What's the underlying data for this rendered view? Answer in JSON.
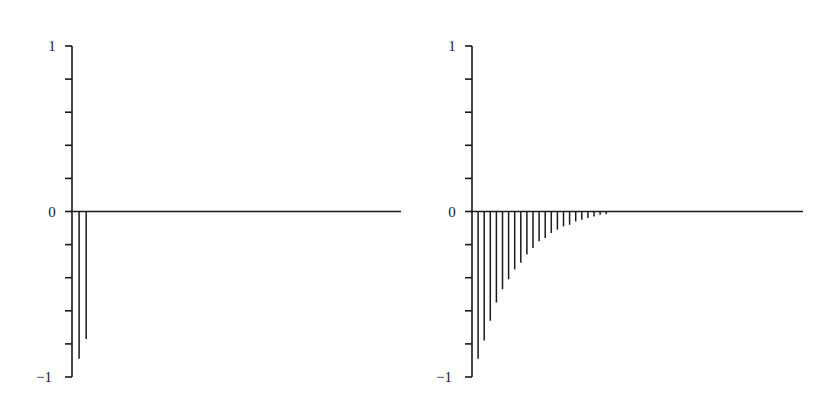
{
  "chart_data": [
    {
      "type": "bar",
      "subtype": "stem",
      "title": "",
      "xlabel": "",
      "ylabel": "",
      "ylim": [
        -1,
        1
      ],
      "yticks": [
        -1,
        -0.8,
        -0.6,
        -0.4,
        -0.2,
        0,
        0.2,
        0.4,
        0.6,
        0.8,
        1
      ],
      "ytick_labels": [
        {
          "value": 1,
          "label": "1"
        },
        {
          "value": 0,
          "label": "0"
        },
        {
          "value": -1,
          "label": "−1"
        }
      ],
      "grid": false,
      "lags": 50,
      "x": [
        1,
        2
      ],
      "values": [
        -0.89,
        -0.77
      ]
    },
    {
      "type": "bar",
      "subtype": "stem",
      "title": "",
      "xlabel": "",
      "ylabel": "",
      "ylim": [
        -1,
        1
      ],
      "yticks": [
        -1,
        -0.8,
        -0.6,
        -0.4,
        -0.2,
        0,
        0.2,
        0.4,
        0.6,
        0.8,
        1
      ],
      "ytick_labels": [
        {
          "value": 1,
          "label": "1"
        },
        {
          "value": 0,
          "label": "0"
        },
        {
          "value": -1,
          "label": "−1"
        }
      ],
      "grid": false,
      "lags": 50,
      "x": [
        1,
        2,
        3,
        4,
        5,
        6,
        7,
        8,
        9,
        10,
        11,
        12,
        13,
        14,
        15,
        16,
        17,
        18,
        19,
        20,
        21,
        22
      ],
      "values": [
        -0.89,
        -0.78,
        -0.66,
        -0.55,
        -0.47,
        -0.41,
        -0.35,
        -0.31,
        -0.26,
        -0.22,
        -0.18,
        -0.16,
        -0.13,
        -0.11,
        -0.09,
        -0.08,
        -0.06,
        -0.05,
        -0.04,
        -0.03,
        -0.02,
        -0.015
      ]
    }
  ],
  "colors": {
    "stroke": "#1a1a1a",
    "background": "#ffffff"
  }
}
